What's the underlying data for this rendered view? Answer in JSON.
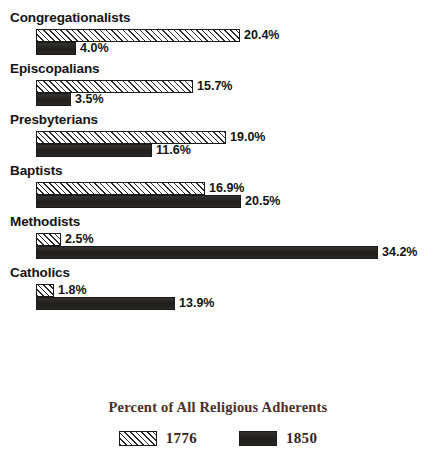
{
  "chart_data": {
    "type": "bar",
    "orientation": "horizontal",
    "title": "",
    "xlabel": "Percent of All Religious Adherents",
    "ylabel": "",
    "grid": false,
    "legend_position": "bottom-center",
    "xlim": [
      0,
      34.2
    ],
    "value_suffix": "%",
    "categories": [
      "Congregationalists",
      "Episcopalians",
      "Presbyterians",
      "Baptists",
      "Methodists",
      "Catholics"
    ],
    "series": [
      {
        "name": "1776",
        "values": [
          20.4,
          15.7,
          19.0,
          16.9,
          2.5,
          1.8
        ],
        "labels": [
          "20.4%",
          "15.7%",
          "19.0%",
          "16.9%",
          "2.5%",
          "1.8%"
        ],
        "fill": "diagonal-hatch",
        "color": "#ffffff"
      },
      {
        "name": "1850",
        "values": [
          4.0,
          3.5,
          11.6,
          20.5,
          34.2,
          13.9
        ],
        "labels": [
          "4.0%",
          "3.5%",
          "11.6%",
          "20.5%",
          "34.2%",
          "13.9%"
        ],
        "fill": "solid",
        "color": "#262422"
      }
    ]
  },
  "axis_title": {
    "text": "Percent of All Religious Adherents",
    "color": "#4a2f2c"
  },
  "legend": {
    "items": [
      {
        "label": "1776",
        "swatch": "hatched-swatch"
      },
      {
        "label": "1850",
        "swatch": "solid-swatch"
      }
    ]
  },
  "groups": [
    {
      "category": "Congregationalists",
      "bars": [
        {
          "series": "1776",
          "value": 20.4,
          "label": "20.4%"
        },
        {
          "series": "1850",
          "value": 4.0,
          "label": "4.0%"
        }
      ]
    },
    {
      "category": "Episcopalians",
      "bars": [
        {
          "series": "1776",
          "value": 15.7,
          "label": "15.7%"
        },
        {
          "series": "1850",
          "value": 3.5,
          "label": "3.5%"
        }
      ]
    },
    {
      "category": "Presbyterians",
      "bars": [
        {
          "series": "1776",
          "value": 19.0,
          "label": "19.0%"
        },
        {
          "series": "1850",
          "value": 11.6,
          "label": "11.6%"
        }
      ]
    },
    {
      "category": "Baptists",
      "bars": [
        {
          "series": "1776",
          "value": 16.9,
          "label": "16.9%"
        },
        {
          "series": "1850",
          "value": 20.5,
          "label": "20.5%"
        }
      ]
    },
    {
      "category": "Methodists",
      "bars": [
        {
          "series": "1776",
          "value": 2.5,
          "label": "2.5%"
        },
        {
          "series": "1850",
          "value": 34.2,
          "label": "34.2%"
        }
      ]
    },
    {
      "category": "Catholics",
      "bars": [
        {
          "series": "1776",
          "value": 1.8,
          "label": "1.8%"
        },
        {
          "series": "1850",
          "value": 13.9,
          "label": "13.9%"
        }
      ]
    }
  ]
}
